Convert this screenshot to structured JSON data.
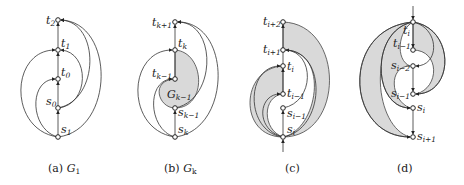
{
  "figure": {
    "panels": [
      {
        "id": "a",
        "caption_prefix": "(a)",
        "caption_math": "G",
        "caption_sub": "1",
        "nodes": [
          {
            "name": "t",
            "sub": "2"
          },
          {
            "name": "t",
            "sub": "1"
          },
          {
            "name": "t",
            "sub": "0"
          },
          {
            "name": "s",
            "sub": "0"
          },
          {
            "name": "s",
            "sub": "1"
          }
        ]
      },
      {
        "id": "b",
        "caption_prefix": "(b)",
        "caption_math": "G",
        "caption_sub": "k",
        "region_label": "G",
        "region_sub": "k−1",
        "nodes": [
          {
            "name": "t",
            "sub": "k+1"
          },
          {
            "name": "t",
            "sub": "k"
          },
          {
            "name": "t",
            "sub": "k−1"
          },
          {
            "name": "s",
            "sub": "k−1"
          },
          {
            "name": "s",
            "sub": "k"
          }
        ]
      },
      {
        "id": "c",
        "caption_prefix": "(c)",
        "nodes": [
          {
            "name": "t",
            "sub": "i+2"
          },
          {
            "name": "t",
            "sub": "i+1"
          },
          {
            "name": "t",
            "sub": "i"
          },
          {
            "name": "t",
            "sub": "i−1"
          },
          {
            "name": "s",
            "sub": "i−1"
          },
          {
            "name": "s",
            "sub": "i"
          }
        ]
      },
      {
        "id": "d",
        "caption_prefix": "(d)",
        "nodes": [
          {
            "name": "t",
            "sub": "i"
          },
          {
            "name": "t",
            "sub": "i−1"
          },
          {
            "name": "s",
            "sub": "i−2"
          },
          {
            "name": "s",
            "sub": "i−1"
          },
          {
            "name": "s",
            "sub": "i"
          },
          {
            "name": "s",
            "sub": "i+1"
          }
        ]
      }
    ],
    "colors": {
      "shade": "#d9d9d9",
      "stroke": "#333333",
      "background": "#ffffff"
    }
  }
}
